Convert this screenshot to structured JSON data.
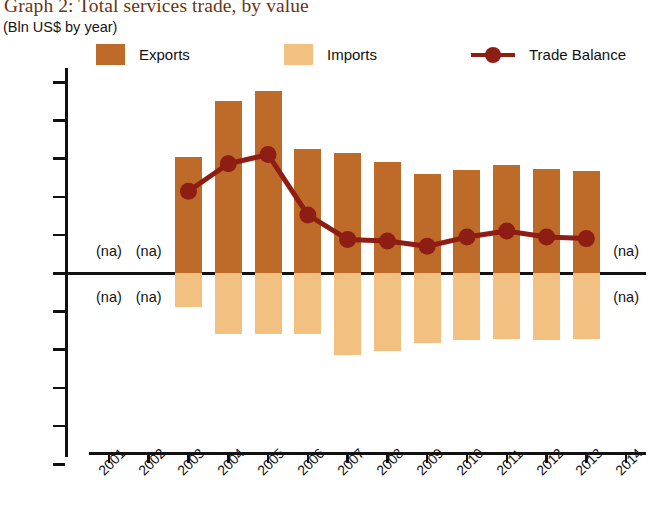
{
  "title": "Graph 2: Total services trade, by value",
  "subtitle": "(Bln US$ by year)",
  "legend": {
    "exports_label": "Exports",
    "imports_label": "Imports",
    "balance_label": "Trade Balance"
  },
  "colors": {
    "exports": "#be6a28",
    "imports": "#f2c182",
    "balance": "#8e1d14",
    "title": "#6b3410",
    "axis": "#111111"
  },
  "na_text": "(na)",
  "na_markers": [
    {
      "year": "2001",
      "side": "above"
    },
    {
      "year": "2002",
      "side": "above"
    },
    {
      "year": "2001",
      "side": "below"
    },
    {
      "year": "2002",
      "side": "below"
    },
    {
      "year": "2014",
      "side": "above"
    },
    {
      "year": "2014",
      "side": "below"
    }
  ],
  "chart_data": {
    "type": "bar",
    "title": "Graph 2: Total services trade, by value",
    "subtitle": "(Bln US$ by year)",
    "xlabel": "",
    "ylabel": "Bln US$",
    "ylim": [
      -2.5,
      2.5
    ],
    "ytick_labels": [
      "2.5",
      "2",
      "1.5",
      "1",
      "0.5",
      "0",
      "−0.5",
      "−1",
      "−1.5",
      "−2",
      "−2.5"
    ],
    "ytick_values": [
      2.5,
      2,
      1.5,
      1,
      0.5,
      0,
      -0.5,
      -1,
      -1.5,
      -2,
      -2.5
    ],
    "categories": [
      "2001",
      "2002",
      "2003",
      "2004",
      "2005",
      "2006",
      "2007",
      "2008",
      "2009",
      "2010",
      "2011",
      "2012",
      "2013",
      "2014"
    ],
    "grid": false,
    "legend_position": "top",
    "series": [
      {
        "name": "Exports",
        "type": "bar",
        "color": "#be6a28",
        "values": [
          null,
          null,
          1.52,
          2.25,
          2.38,
          1.62,
          1.57,
          1.45,
          1.3,
          1.35,
          1.42,
          1.36,
          1.34,
          null
        ]
      },
      {
        "name": "Imports",
        "type": "bar",
        "color": "#f2c182",
        "values": [
          null,
          null,
          -0.45,
          -0.8,
          -0.8,
          -0.8,
          -1.07,
          -1.02,
          -0.92,
          -0.88,
          -0.86,
          -0.88,
          -0.86,
          null
        ]
      },
      {
        "name": "Trade Balance",
        "type": "line",
        "color": "#8e1d14",
        "values": [
          null,
          null,
          1.07,
          1.43,
          1.55,
          0.76,
          0.44,
          0.42,
          0.35,
          0.47,
          0.55,
          0.47,
          0.45,
          null
        ]
      }
    ]
  }
}
